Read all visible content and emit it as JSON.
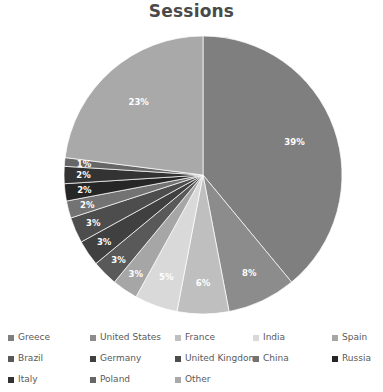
{
  "chart_data": {
    "type": "pie",
    "title": "Sessions",
    "xlabel": "",
    "ylabel": "",
    "legend_position": "bottom",
    "grid": false,
    "label_format": "percent",
    "start_angle_deg": 0,
    "direction": "clockwise",
    "categories": [
      "Greece",
      "United States",
      "France",
      "India",
      "Spain",
      "Brazil",
      "Germany",
      "United Kingdom",
      "China",
      "Russia",
      "Italy",
      "Poland",
      "Other"
    ],
    "values": [
      39,
      8,
      6,
      5,
      3,
      3,
      3,
      3,
      2,
      2,
      2,
      1,
      23
    ],
    "labels": [
      "39%",
      "8%",
      "6%",
      "5%",
      "3%",
      "3%",
      "3%",
      "3%",
      "2%",
      "2%",
      "2%",
      "1%",
      "23%"
    ],
    "colors": [
      "#7f7f7f",
      "#8c8c8c",
      "#bfbfbf",
      "#d9d9d9",
      "#a6a6a6",
      "#595959",
      "#404040",
      "#4d4d4d",
      "#737373",
      "#262626",
      "#333333",
      "#666666",
      "#a9a9a9"
    ],
    "slices": [
      {
        "name": "Greece",
        "value": 39,
        "label": "39%",
        "color": "#7f7f7f"
      },
      {
        "name": "United States",
        "value": 8,
        "label": "8%",
        "color": "#8c8c8c"
      },
      {
        "name": "France",
        "value": 6,
        "label": "6%",
        "color": "#bfbfbf"
      },
      {
        "name": "India",
        "value": 5,
        "label": "5%",
        "color": "#d9d9d9"
      },
      {
        "name": "Spain",
        "value": 3,
        "label": "3%",
        "color": "#a6a6a6"
      },
      {
        "name": "Brazil",
        "value": 3,
        "label": "3%",
        "color": "#595959"
      },
      {
        "name": "Germany",
        "value": 3,
        "label": "3%",
        "color": "#404040"
      },
      {
        "name": "United Kingdom",
        "value": 3,
        "label": "3%",
        "color": "#4d4d4d"
      },
      {
        "name": "China",
        "value": 2,
        "label": "2%",
        "color": "#737373"
      },
      {
        "name": "Russia",
        "value": 2,
        "label": "2%",
        "color": "#262626"
      },
      {
        "name": "Italy",
        "value": 2,
        "label": "2%",
        "color": "#333333"
      },
      {
        "name": "Poland",
        "value": 1,
        "label": "1%",
        "color": "#666666"
      },
      {
        "name": "Other",
        "value": 23,
        "label": "23%",
        "color": "#a9a9a9"
      }
    ]
  },
  "legend": {
    "items": [
      {
        "label": "Greece",
        "color": "#7f7f7f",
        "col": 0,
        "row": 0
      },
      {
        "label": "United States",
        "color": "#8c8c8c",
        "col": 1,
        "row": 0
      },
      {
        "label": "France",
        "color": "#bfbfbf",
        "col": 2,
        "row": 0
      },
      {
        "label": "India",
        "color": "#d9d9d9",
        "col": 3,
        "row": 0
      },
      {
        "label": "Spain",
        "color": "#a6a6a6",
        "col": 4,
        "row": 0
      },
      {
        "label": "Brazil",
        "color": "#595959",
        "col": 0,
        "row": 1
      },
      {
        "label": "Germany",
        "color": "#404040",
        "col": 1,
        "row": 1
      },
      {
        "label": "United Kingdom",
        "color": "#4d4d4d",
        "col": 2,
        "row": 1
      },
      {
        "label": "China",
        "color": "#737373",
        "col": 3,
        "row": 1
      },
      {
        "label": "Russia",
        "color": "#262626",
        "col": 4,
        "row": 1
      },
      {
        "label": "Italy",
        "color": "#333333",
        "col": 0,
        "row": 2
      },
      {
        "label": "Poland",
        "color": "#666666",
        "col": 1,
        "row": 2
      },
      {
        "label": "Other",
        "color": "#a9a9a9",
        "col": 2,
        "row": 2
      }
    ]
  },
  "geometry": {
    "center_x": 203,
    "center_y": 153,
    "radius": 139
  }
}
